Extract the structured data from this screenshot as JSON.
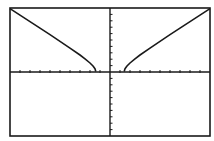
{
  "screen": {
    "background": "#ffffff",
    "ink": "#1a1a1a",
    "frame": {
      "x": 10,
      "y": 8,
      "width": 200,
      "height": 128
    }
  },
  "chart_data": {
    "type": "line",
    "title": "",
    "xlabel": "",
    "ylabel": "",
    "function": "y = sqrt(x^2 - 2)",
    "xlim": [
      -10,
      10
    ],
    "ylim": [
      -10,
      10
    ],
    "xscl": 1,
    "yscl": 1,
    "grid": false,
    "legend": null,
    "series": [
      {
        "name": "left-branch",
        "x": [
          -10,
          -9,
          -8,
          -7,
          -6,
          -5,
          -4,
          -3,
          -2.5,
          -2,
          -1.7,
          -1.5,
          -1.42
        ],
        "y": [
          9.9,
          8.89,
          7.87,
          6.86,
          5.83,
          4.8,
          3.74,
          2.65,
          2.06,
          1.41,
          0.93,
          0.5,
          0.1
        ]
      },
      {
        "name": "right-branch",
        "x": [
          1.42,
          1.5,
          1.7,
          2,
          2.5,
          3,
          4,
          5,
          6,
          7,
          8,
          9,
          10
        ],
        "y": [
          0.1,
          0.5,
          0.93,
          1.41,
          2.06,
          2.65,
          3.74,
          4.8,
          5.83,
          6.86,
          7.87,
          8.89,
          9.9
        ]
      }
    ]
  }
}
